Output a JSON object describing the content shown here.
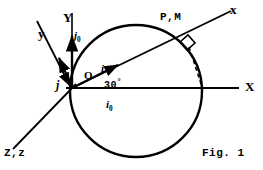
{
  "figure": {
    "caption": "Fig. 1",
    "stroke_color": "#000000",
    "background_color": "#ffffff",
    "width": 263,
    "height": 170
  },
  "labels": {
    "axis_Y": "Y",
    "axis_X": "X",
    "axis_x_small": "x",
    "axis_y_small": "y",
    "axis_Zz": "Z,z",
    "origin": "O",
    "point_PM": "P,M",
    "angle": "30",
    "angle_unit": "°",
    "unit_i": "i",
    "unit_j": "j",
    "unit_i0_base": "i",
    "unit_i0_sub": "0",
    "unit_j0_base": "j",
    "unit_j0_sub": "0"
  },
  "geometry": {
    "origin": {
      "x": 72,
      "y": 88
    },
    "circle": {
      "cx": 136,
      "cy": 91,
      "r": 66
    },
    "rotation_deg": 30,
    "axis_X": {
      "x1": 72,
      "y1": 88,
      "x2": 238,
      "y2": 88
    },
    "axis_Y": {
      "x1": 72,
      "y1": 88,
      "x2": 72,
      "y2": 14
    },
    "axis_x_small": {
      "x1": 72,
      "y1": 88,
      "x2": 228,
      "y2": 12
    },
    "axis_y_small": {
      "x1": 72,
      "y1": 88,
      "x2": 38,
      "y2": 22
    },
    "axis_Zz": {
      "x1": 72,
      "y1": 88,
      "x2": 14,
      "y2": 148
    },
    "point_P": {
      "x": 192,
      "y": 44
    },
    "foot_point": {
      "x": 201,
      "y": 88
    },
    "unit_vec_i": {
      "x1": 72,
      "y1": 88,
      "x2": 120,
      "y2": 64
    },
    "unit_vec_j0": {
      "x1": 72,
      "y1": 88,
      "x2": 72,
      "y2": 36
    },
    "unit_vec_j": {
      "x1": 72,
      "y1": 88,
      "x2": 57,
      "y2": 52
    }
  }
}
